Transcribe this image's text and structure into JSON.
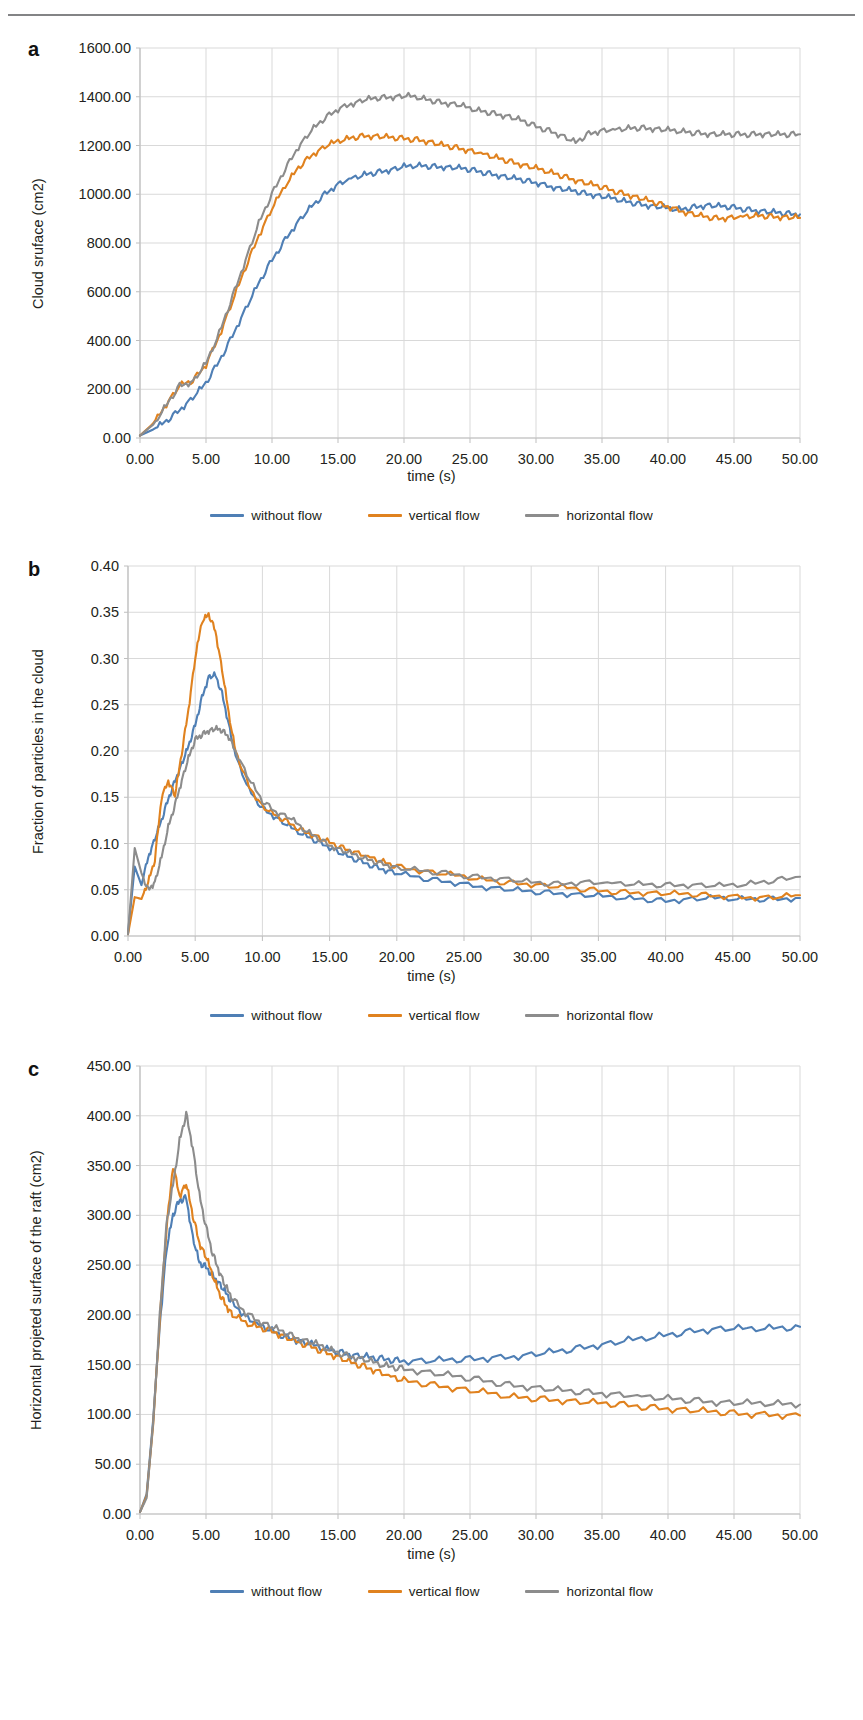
{
  "figure": {
    "running_head": "",
    "panels": [
      "a",
      "b",
      "c"
    ]
  },
  "legend": {
    "items": [
      {
        "label": "without flow",
        "color": "#4f7fb5",
        "name": "legend-without-flow"
      },
      {
        "label": "vertical flow",
        "color": "#e0821f",
        "name": "legend-vertical-flow"
      },
      {
        "label": "horizontal flow",
        "color": "#8c8c8c",
        "name": "legend-horizontal-flow"
      }
    ]
  },
  "chart_data": [
    {
      "panel": "a",
      "type": "line",
      "title": "",
      "xlabel": "time (s)",
      "ylabel": "Cloud sruface (cm2)",
      "xlim": [
        0,
        50
      ],
      "ylim": [
        0,
        1600
      ],
      "xticks": [
        "0.00",
        "5.00",
        "10.00",
        "15.00",
        "20.00",
        "25.00",
        "30.00",
        "35.00",
        "40.00",
        "45.00",
        "50.00"
      ],
      "yticks": [
        "0.00",
        "200.00",
        "400.00",
        "600.00",
        "800.00",
        "1000.00",
        "1200.00",
        "1400.00",
        "1600.00"
      ],
      "grid": true,
      "legend_position": "bottom",
      "x": [
        0,
        1,
        2,
        3,
        4,
        5,
        6,
        7,
        8,
        9,
        10,
        11,
        12,
        13,
        14,
        15,
        16,
        17,
        18,
        19,
        20,
        21,
        22,
        23,
        24,
        25,
        26,
        27,
        28,
        29,
        30,
        31,
        32,
        33,
        34,
        35,
        36,
        37,
        38,
        39,
        40,
        41,
        42,
        43,
        44,
        45,
        46,
        47,
        48,
        49,
        50
      ],
      "series": [
        {
          "name": "without flow",
          "color": "#4f7fb5",
          "values": [
            10,
            35,
            70,
            115,
            165,
            225,
            315,
            420,
            530,
            635,
            730,
            815,
            890,
            950,
            1000,
            1040,
            1065,
            1080,
            1090,
            1100,
            1112,
            1118,
            1115,
            1112,
            1108,
            1100,
            1090,
            1080,
            1068,
            1058,
            1046,
            1034,
            1022,
            1012,
            1000,
            990,
            980,
            968,
            958,
            950,
            942,
            938,
            948,
            955,
            950,
            945,
            938,
            932,
            926,
            920,
            918
          ]
        },
        {
          "name": "vertical flow",
          "color": "#e0821f",
          "values": [
            10,
            60,
            140,
            215,
            235,
            300,
            420,
            560,
            700,
            830,
            940,
            1035,
            1110,
            1160,
            1195,
            1218,
            1232,
            1240,
            1238,
            1232,
            1228,
            1225,
            1215,
            1200,
            1190,
            1178,
            1165,
            1150,
            1135,
            1120,
            1105,
            1092,
            1075,
            1058,
            1042,
            1028,
            1012,
            998,
            982,
            965,
            948,
            932,
            918,
            905,
            900,
            905,
            910,
            912,
            908,
            905,
            903
          ]
        },
        {
          "name": "horizontal flow",
          "color": "#8c8c8c",
          "values": [
            10,
            55,
            135,
            215,
            230,
            305,
            430,
            580,
            730,
            880,
            1000,
            1105,
            1195,
            1262,
            1312,
            1348,
            1372,
            1388,
            1395,
            1398,
            1402,
            1398,
            1385,
            1375,
            1368,
            1352,
            1340,
            1330,
            1318,
            1300,
            1278,
            1262,
            1240,
            1212,
            1248,
            1260,
            1265,
            1270,
            1272,
            1268,
            1262,
            1258,
            1252,
            1248,
            1245,
            1244,
            1246,
            1248,
            1246,
            1244,
            1246
          ]
        }
      ]
    },
    {
      "panel": "b",
      "type": "line",
      "title": "",
      "xlabel": "time (s)",
      "ylabel": "Fraction of particles in the cloud",
      "xlim": [
        0,
        50
      ],
      "ylim": [
        0,
        0.4
      ],
      "xticks": [
        "0.00",
        "5.00",
        "10.00",
        "15.00",
        "20.00",
        "25.00",
        "30.00",
        "35.00",
        "40.00",
        "45.00",
        "50.00"
      ],
      "yticks": [
        "0.00",
        "0.05",
        "0.10",
        "0.15",
        "0.20",
        "0.25",
        "0.30",
        "0.35",
        "0.40"
      ],
      "grid": true,
      "legend_position": "bottom",
      "x": [
        0,
        0.5,
        1,
        1.5,
        2,
        2.5,
        3,
        3.5,
        4,
        4.5,
        5,
        5.5,
        6,
        6.5,
        7,
        7.5,
        8,
        9,
        10,
        11,
        12,
        13,
        14,
        15,
        16,
        17,
        18,
        19,
        20,
        22,
        24,
        26,
        28,
        30,
        32,
        34,
        36,
        38,
        40,
        42,
        44,
        46,
        48,
        50
      ],
      "series": [
        {
          "name": "without flow",
          "color": "#4f7fb5",
          "values": [
            0.003,
            0.075,
            0.055,
            0.085,
            0.105,
            0.125,
            0.148,
            0.168,
            0.186,
            0.205,
            0.228,
            0.258,
            0.28,
            0.282,
            0.262,
            0.228,
            0.195,
            0.158,
            0.138,
            0.128,
            0.118,
            0.11,
            0.103,
            0.096,
            0.088,
            0.082,
            0.077,
            0.072,
            0.068,
            0.062,
            0.058,
            0.054,
            0.051,
            0.048,
            0.046,
            0.044,
            0.042,
            0.04,
            0.038,
            0.04,
            0.041,
            0.04,
            0.04,
            0.041
          ]
        },
        {
          "name": "vertical flow",
          "color": "#e0821f",
          "values": [
            0.002,
            0.042,
            0.04,
            0.058,
            0.082,
            0.15,
            0.168,
            0.152,
            0.198,
            0.245,
            0.3,
            0.34,
            0.348,
            0.33,
            0.288,
            0.24,
            0.2,
            0.162,
            0.14,
            0.13,
            0.122,
            0.114,
            0.108,
            0.101,
            0.095,
            0.09,
            0.085,
            0.08,
            0.075,
            0.07,
            0.066,
            0.062,
            0.058,
            0.056,
            0.053,
            0.05,
            0.048,
            0.047,
            0.046,
            0.045,
            0.043,
            0.042,
            0.042,
            0.044
          ]
        },
        {
          "name": "horizontal flow",
          "color": "#8c8c8c",
          "values": [
            0.002,
            0.095,
            0.068,
            0.05,
            0.058,
            0.085,
            0.118,
            0.142,
            0.168,
            0.192,
            0.212,
            0.218,
            0.222,
            0.224,
            0.222,
            0.215,
            0.2,
            0.17,
            0.146,
            0.134,
            0.128,
            0.116,
            0.107,
            0.098,
            0.092,
            0.087,
            0.082,
            0.078,
            0.074,
            0.07,
            0.067,
            0.064,
            0.062,
            0.058,
            0.056,
            0.058,
            0.057,
            0.056,
            0.055,
            0.055,
            0.054,
            0.056,
            0.06,
            0.064
          ]
        }
      ]
    },
    {
      "panel": "c",
      "type": "line",
      "title": "",
      "xlabel": "time (s)",
      "ylabel": "Horizontal projeted surface of the raft (cm2)",
      "xlim": [
        0,
        50
      ],
      "ylim": [
        0,
        450
      ],
      "xticks": [
        "0.00",
        "5.00",
        "10.00",
        "15.00",
        "20.00",
        "25.00",
        "30.00",
        "35.00",
        "40.00",
        "45.00",
        "50.00"
      ],
      "yticks": [
        "0.00",
        "50.00",
        "100.00",
        "150.00",
        "200.00",
        "250.00",
        "300.00",
        "350.00",
        "400.00",
        "450.00"
      ],
      "grid": true,
      "legend_position": "bottom",
      "x": [
        0,
        0.5,
        1,
        1.5,
        2,
        2.5,
        3,
        3.5,
        4,
        4.5,
        5,
        5.5,
        6,
        6.5,
        7,
        8,
        9,
        10,
        11,
        12,
        13,
        14,
        15,
        16,
        17,
        18,
        19,
        20,
        22,
        24,
        26,
        28,
        30,
        32,
        34,
        36,
        38,
        40,
        42,
        44,
        46,
        48,
        50
      ],
      "series": [
        {
          "name": "without flow",
          "color": "#4f7fb5",
          "values": [
            2,
            20,
            95,
            190,
            265,
            300,
            315,
            318,
            278,
            252,
            248,
            240,
            232,
            222,
            212,
            198,
            190,
            184,
            178,
            174,
            170,
            166,
            163,
            160,
            158,
            156,
            155,
            154,
            154,
            155,
            156,
            158,
            161,
            164,
            168,
            172,
            176,
            180,
            184,
            186,
            186,
            187,
            188
          ]
        },
        {
          "name": "vertical flow",
          "color": "#e0821f",
          "values": [
            2,
            18,
            90,
            195,
            285,
            350,
            320,
            332,
            300,
            272,
            258,
            240,
            222,
            210,
            200,
            192,
            188,
            184,
            178,
            172,
            168,
            163,
            158,
            152,
            148,
            143,
            138,
            134,
            130,
            126,
            122,
            118,
            116,
            114,
            112,
            110,
            108,
            106,
            104,
            102,
            100,
            100,
            99
          ]
        },
        {
          "name": "horizontal flow",
          "color": "#8c8c8c",
          "values": [
            2,
            16,
            92,
            200,
            290,
            330,
            375,
            402,
            368,
            320,
            288,
            262,
            244,
            228,
            216,
            202,
            194,
            188,
            182,
            176,
            172,
            167,
            162,
            158,
            155,
            151,
            148,
            146,
            142,
            138,
            134,
            130,
            127,
            124,
            122,
            120,
            118,
            116,
            114,
            112,
            111,
            111,
            110
          ]
        }
      ]
    }
  ]
}
